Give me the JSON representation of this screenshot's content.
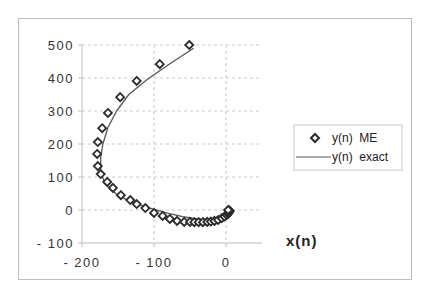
{
  "chart_data": {
    "type": "scatter",
    "title": "",
    "xlabel": "x(n)",
    "ylabel": "",
    "xlim": [
      -200,
      50
    ],
    "ylim": [
      -100,
      500
    ],
    "x_ticks": [
      "-200",
      "-100",
      "0"
    ],
    "y_ticks": [
      "-100",
      "0",
      "100",
      "200",
      "300",
      "400",
      "500"
    ],
    "grid": true,
    "legend_position": "right",
    "series": [
      {
        "name": "y(n)  ME",
        "style": "markers-diamond",
        "x": [
          -51,
          -92,
          -124,
          -147,
          -164,
          -172,
          -178,
          -179,
          -178,
          -174,
          -165,
          -157,
          -146,
          -133,
          -124,
          -112,
          -100,
          -88,
          -78,
          -68,
          -58,
          -50,
          -44,
          -38,
          -32,
          -26,
          -21,
          -16,
          -11,
          -6,
          -2,
          1,
          3,
          4,
          5,
          5,
          4,
          3
        ],
        "y": [
          500,
          442,
          391,
          342,
          294,
          248,
          206,
          170,
          133,
          109,
          85,
          67,
          45,
          30,
          18,
          6,
          -9,
          -18,
          -27,
          -33,
          -36,
          -36,
          -37,
          -37,
          -37,
          -36,
          -35,
          -33,
          -30,
          -25,
          -20,
          -15,
          -11,
          -7,
          -4,
          -2,
          -1,
          0
        ]
      },
      {
        "name": "y(n)  exact",
        "style": "line",
        "x": [
          -45,
          -80,
          -110,
          -135,
          -152,
          -164,
          -171,
          -174,
          -174,
          -170,
          -162,
          -150,
          -135,
          -118,
          -100,
          -80,
          -60,
          -40,
          -22,
          -8,
          2,
          5,
          4
        ],
        "y": [
          490,
          440,
          395,
          350,
          300,
          250,
          200,
          160,
          120,
          90,
          65,
          45,
          28,
          14,
          2,
          -10,
          -20,
          -27,
          -28,
          -24,
          -15,
          -7,
          -2
        ]
      }
    ]
  },
  "legend": {
    "items": [
      {
        "label": "y(n)  ME",
        "marker": "diamond"
      },
      {
        "label": "y(n)  exact",
        "marker": "line"
      }
    ]
  },
  "axes": {
    "x_title": "x(n)"
  },
  "colors": {
    "marker": "#2a2a2a",
    "line": "#555555",
    "grid": "#c8c8c8",
    "axis": "#bdbdbd"
  }
}
